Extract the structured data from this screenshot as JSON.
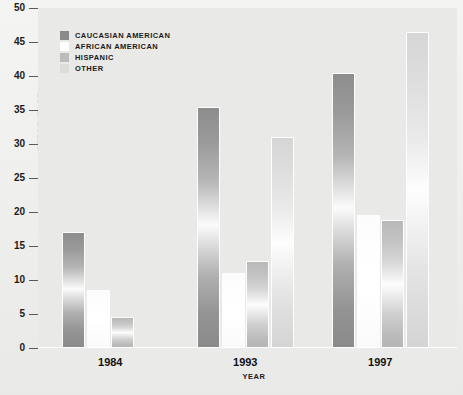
{
  "chart_data": {
    "type": "bar",
    "title": "",
    "xlabel": "YEAR",
    "ylabel": "PERCENTAGE",
    "ylim": [
      0,
      50
    ],
    "ytick_values": [
      0,
      5,
      10,
      15,
      20,
      25,
      30,
      35,
      40,
      45,
      50
    ],
    "ytick_labels": [
      "0",
      "5",
      "10",
      "15",
      "20",
      "25",
      "30",
      "35",
      "40",
      "45",
      "50"
    ],
    "grid": false,
    "legend_position": "top-left-inside",
    "categories": [
      "1984",
      "1993",
      "1997"
    ],
    "series": [
      {
        "name": "CAUCASIAN AMERICAN",
        "color": "#8b8b8b",
        "values": [
          17.0,
          35.5,
          40.5
        ]
      },
      {
        "name": "AFRICAN AMERICAN",
        "color": "#ffffff",
        "values": [
          8.5,
          11.0,
          19.5
        ]
      },
      {
        "name": "HISPANIC",
        "color": "#bcbcbc",
        "values": [
          4.5,
          12.8,
          18.8
        ]
      },
      {
        "name": "OTHER",
        "color": "#dcdcdc",
        "values": [
          0.0,
          31.0,
          46.5
        ]
      }
    ]
  },
  "legend": {
    "items": [
      {
        "label": "CAUCASIAN AMERICAN",
        "swatch": "legend-swatch-caucasian-american"
      },
      {
        "label": "AFRICAN AMERICAN",
        "swatch": "legend-swatch-african-american"
      },
      {
        "label": "HISPANIC",
        "swatch": "legend-swatch-hispanic"
      },
      {
        "label": "OTHER",
        "swatch": "legend-swatch-other"
      }
    ]
  },
  "colors": {
    "page_background": "#f1f1f0",
    "plot_background": "#e9e9e7",
    "axis_text": "#1a1a1a",
    "tick_mark": "#595959",
    "bar_outline": "#fdfdfd"
  }
}
